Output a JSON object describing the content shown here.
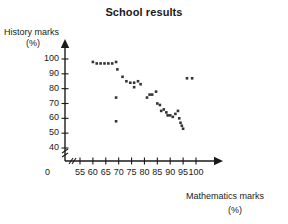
{
  "chart_data": {
    "type": "scatter",
    "title": "School results",
    "xlabel": "Mathematics marks",
    "xlabel_unit": "(%)",
    "ylabel": "History marks",
    "ylabel_unit": "(%)",
    "xlim": [
      55,
      101
    ],
    "ylim": [
      36,
      104
    ],
    "x_ticks": [
      55,
      60,
      65,
      70,
      75,
      80,
      85,
      90,
      95,
      100
    ],
    "y_ticks": [
      40,
      50,
      60,
      70,
      80,
      90,
      100
    ],
    "origin_label": "0",
    "axis_break_x": true,
    "axis_break_y": true,
    "grid": false,
    "legend": false,
    "marker_color": "#333333",
    "axis_color": "#1a1a1a",
    "points": [
      {
        "x": 60,
        "y": 98
      },
      {
        "x": 61.5,
        "y": 97
      },
      {
        "x": 63,
        "y": 97
      },
      {
        "x": 64.5,
        "y": 97
      },
      {
        "x": 66,
        "y": 97
      },
      {
        "x": 67.5,
        "y": 97
      },
      {
        "x": 69,
        "y": 98
      },
      {
        "x": 69.5,
        "y": 93
      },
      {
        "x": 69,
        "y": 74
      },
      {
        "x": 69,
        "y": 58
      },
      {
        "x": 71.5,
        "y": 88
      },
      {
        "x": 73,
        "y": 85
      },
      {
        "x": 74.5,
        "y": 84
      },
      {
        "x": 76,
        "y": 84
      },
      {
        "x": 76,
        "y": 81
      },
      {
        "x": 77.5,
        "y": 85
      },
      {
        "x": 78.5,
        "y": 83
      },
      {
        "x": 81,
        "y": 74
      },
      {
        "x": 82,
        "y": 76
      },
      {
        "x": 83,
        "y": 76
      },
      {
        "x": 84.5,
        "y": 78
      },
      {
        "x": 85,
        "y": 70
      },
      {
        "x": 86,
        "y": 69
      },
      {
        "x": 86.5,
        "y": 65
      },
      {
        "x": 87.5,
        "y": 66
      },
      {
        "x": 88.5,
        "y": 64
      },
      {
        "x": 89,
        "y": 62
      },
      {
        "x": 90,
        "y": 62
      },
      {
        "x": 91,
        "y": 61
      },
      {
        "x": 92,
        "y": 63
      },
      {
        "x": 93,
        "y": 65
      },
      {
        "x": 93.5,
        "y": 60
      },
      {
        "x": 94,
        "y": 57
      },
      {
        "x": 94.5,
        "y": 55
      },
      {
        "x": 95,
        "y": 53
      },
      {
        "x": 96.5,
        "y": 87
      },
      {
        "x": 98.5,
        "y": 87
      }
    ]
  }
}
